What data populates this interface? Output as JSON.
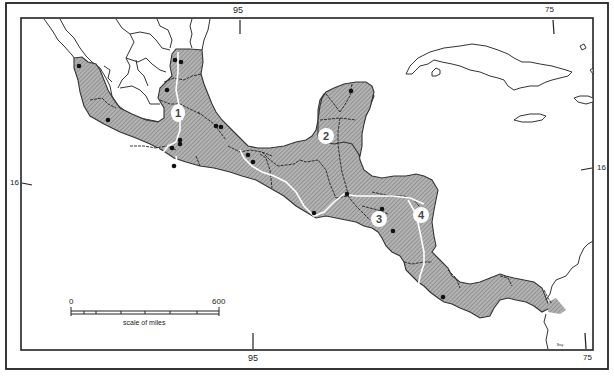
{
  "map": {
    "colors": {
      "land_fill": "#a9a9a9",
      "hatch_line": "#7d7d7d",
      "outline": "#333333",
      "frame": "#222222",
      "route_line": "#ffffff",
      "site_dot": "#111111"
    },
    "graticule": {
      "top": [
        {
          "label": "95",
          "x": 239
        },
        {
          "label": "75",
          "x": 549
        }
      ],
      "bottom": [
        {
          "label": "95",
          "x": 253
        },
        {
          "label": "75",
          "x": 589
        }
      ],
      "left": [
        {
          "label": "16",
          "y": 184
        }
      ],
      "right": [
        {
          "label": "16",
          "y": 168
        }
      ]
    },
    "regions": [
      {
        "number": "1",
        "x": 178,
        "y": 112
      },
      {
        "number": "2",
        "x": 326,
        "y": 136
      },
      {
        "number": "3",
        "x": 379,
        "y": 219
      },
      {
        "number": "4",
        "x": 421,
        "y": 215
      }
    ],
    "sites": [
      [
        79,
        66
      ],
      [
        108,
        120
      ],
      [
        175,
        60
      ],
      [
        181,
        62
      ],
      [
        167,
        90
      ],
      [
        180,
        140
      ],
      [
        180,
        144
      ],
      [
        172,
        148
      ],
      [
        174,
        166
      ],
      [
        216,
        126
      ],
      [
        221,
        127
      ],
      [
        248,
        155
      ],
      [
        253,
        162
      ],
      [
        351,
        91
      ],
      [
        347,
        194
      ],
      [
        314,
        213
      ],
      [
        382,
        209
      ],
      [
        393,
        231
      ],
      [
        443,
        297
      ]
    ],
    "scale_bar": {
      "start_label": "0",
      "end_label": "600",
      "caption": "scale of miles"
    },
    "credit": "Bray"
  }
}
